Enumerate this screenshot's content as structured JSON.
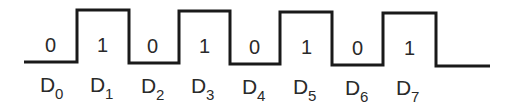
{
  "diagram": {
    "type": "digital-waveform",
    "bits": [
      {
        "value": "0",
        "label": "D",
        "sub": "0"
      },
      {
        "value": "1",
        "label": "D",
        "sub": "1"
      },
      {
        "value": "0",
        "label": "D",
        "sub": "2"
      },
      {
        "value": "1",
        "label": "D",
        "sub": "3"
      },
      {
        "value": "0",
        "label": "D",
        "sub": "4"
      },
      {
        "value": "1",
        "label": "D",
        "sub": "5"
      },
      {
        "value": "0",
        "label": "D",
        "sub": "6"
      },
      {
        "value": "1",
        "label": "D",
        "sub": "7"
      }
    ],
    "line_color": "#1a1a1a"
  }
}
